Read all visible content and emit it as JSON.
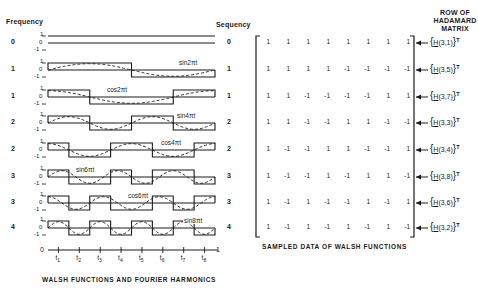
{
  "headers": {
    "frequency": "Frequency",
    "sequency": "Sequency",
    "hadamard_row": [
      "ROW OF",
      "HADAMARD",
      "MATRIX"
    ]
  },
  "captions": {
    "left": "WALSH FUNCTIONS AND FOURIER HARMONICS",
    "right": "SAMPLED DATA OF WALSH FUNCTIONS"
  },
  "axis": {
    "start": "0",
    "end": "1",
    "ticks": [
      "t1",
      "t2",
      "t3",
      "t4",
      "t5",
      "t6",
      "t7",
      "t8"
    ],
    "level_labels": [
      "1",
      "0",
      "-1"
    ]
  },
  "rows": [
    {
      "frequency": "0",
      "sequency": "0",
      "harmonic": "",
      "walsh": [
        1,
        1,
        1,
        1,
        1,
        1,
        1,
        1
      ],
      "hadamard": "3,1"
    },
    {
      "frequency": "1",
      "sequency": "1",
      "harmonic": "sin2πt",
      "walsh": [
        1,
        1,
        1,
        1,
        -1,
        -1,
        -1,
        -1
      ],
      "hadamard": "3,5"
    },
    {
      "frequency": "1",
      "sequency": "1",
      "harmonic": "cos2πt",
      "walsh": [
        1,
        1,
        -1,
        -1,
        -1,
        -1,
        1,
        1
      ],
      "hadamard": "3,7"
    },
    {
      "frequency": "2",
      "sequency": "2",
      "harmonic": "sin4πt",
      "walsh": [
        1,
        1,
        -1,
        -1,
        1,
        1,
        -1,
        -1
      ],
      "hadamard": "3,3"
    },
    {
      "frequency": "2",
      "sequency": "2",
      "harmonic": "cos4πt",
      "walsh": [
        1,
        -1,
        -1,
        1,
        1,
        -1,
        -1,
        1
      ],
      "hadamard": "3,4"
    },
    {
      "frequency": "3",
      "sequency": "3",
      "harmonic": "sin6πt",
      "walsh": [
        1,
        -1,
        -1,
        1,
        -1,
        1,
        1,
        -1
      ],
      "hadamard": "3,8"
    },
    {
      "frequency": "3",
      "sequency": "3",
      "harmonic": "cos6πt",
      "walsh": [
        1,
        -1,
        1,
        -1,
        -1,
        1,
        -1,
        1
      ],
      "hadamard": "3,6"
    },
    {
      "frequency": "4",
      "sequency": "4",
      "harmonic": "sin8πt",
      "walsh": [
        1,
        -1,
        1,
        -1,
        1,
        -1,
        1,
        -1
      ],
      "hadamard": "3,2"
    }
  ],
  "matrix_display": [
    [
      "1",
      "1",
      "1",
      "1",
      "1",
      "1",
      "1",
      "1"
    ],
    [
      "1",
      "1",
      "1",
      "1",
      "-1",
      "-1",
      "-1",
      "-1"
    ],
    [
      "1",
      "1",
      "-1",
      "-1",
      "-1",
      "-1",
      "1",
      "1"
    ],
    [
      "1",
      "1",
      "-1",
      "-1",
      "1",
      "1",
      "-1",
      "-1"
    ],
    [
      "1",
      "-1",
      "-1",
      "1",
      "1",
      "-1",
      "-1",
      "1"
    ],
    [
      "1",
      "-1",
      "-1",
      "1",
      "-1",
      "1",
      "1",
      "-1"
    ],
    [
      "1",
      "-1",
      "1",
      "-1",
      "-1",
      "1",
      "-1",
      "1"
    ],
    [
      "1",
      "-1",
      "1",
      "-1",
      "1",
      "-1",
      "1",
      "-1"
    ]
  ],
  "hadamard_labels": [
    {
      "prefix": "{",
      "H": "H",
      "args": "(3,1)",
      "suffix": "}",
      "sup": "T"
    },
    {
      "prefix": "{",
      "H": "H",
      "args": "(3,5)",
      "suffix": "}",
      "sup": "T"
    },
    {
      "prefix": "{",
      "H": "H",
      "args": "(3,7)",
      "suffix": "}",
      "sup": "T"
    },
    {
      "prefix": "{",
      "H": "H",
      "args": "(3,3)",
      "suffix": "}",
      "sup": "T"
    },
    {
      "prefix": "{",
      "H": "H",
      "args": "(3,4)",
      "suffix": "}",
      "sup": "T"
    },
    {
      "prefix": "{",
      "H": "H",
      "args": "(3,8)",
      "suffix": "}",
      "sup": "T"
    },
    {
      "prefix": "{",
      "H": "H",
      "args": "(3,6)",
      "suffix": "}",
      "sup": "T"
    },
    {
      "prefix": "{",
      "H": "H",
      "args": "(3,2)",
      "suffix": "}",
      "sup": "T"
    }
  ],
  "colors": {
    "ink": "#1a1a1a",
    "background": "#ffffff"
  }
}
